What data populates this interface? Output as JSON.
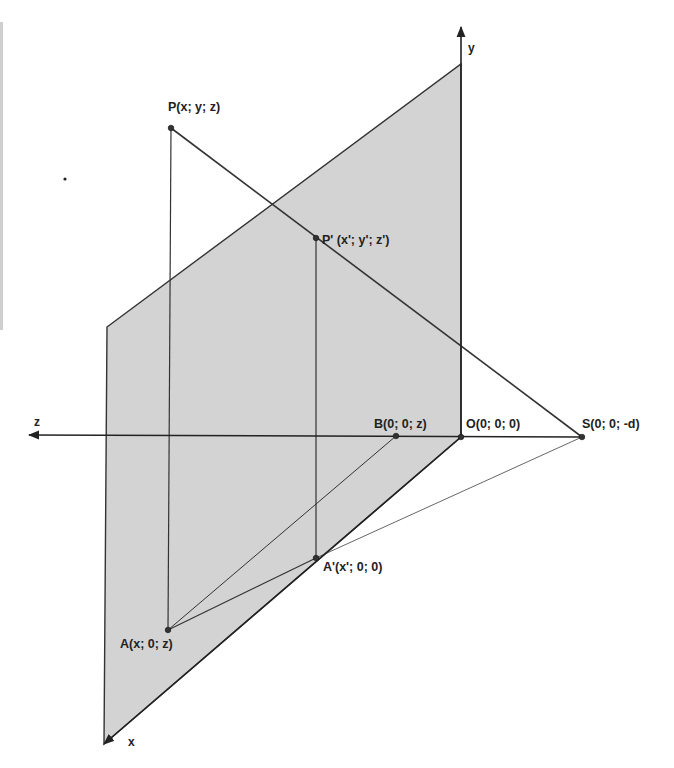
{
  "diagram": {
    "colors": {
      "plane_fill": "#d3d3d3",
      "line": "#333333",
      "thin_line": "#555555",
      "background": "#ffffff"
    },
    "axes": {
      "x": {
        "label": "x",
        "from": [
          461,
          437
        ],
        "to": [
          104,
          744
        ],
        "label_pos": [
          128,
          746
        ]
      },
      "y": {
        "label": "y",
        "from": [
          461,
          437
        ],
        "to": [
          461,
          27
        ],
        "label_pos": [
          468,
          52
        ]
      },
      "z": {
        "label": "z",
        "from": [
          582,
          437
        ],
        "to": [
          29,
          435
        ],
        "label_pos": [
          34,
          426
        ]
      }
    },
    "plane": {
      "name": "projection plane",
      "points": [
        [
          107,
          327
        ],
        [
          461,
          64
        ],
        [
          461,
          437
        ],
        [
          104,
          744
        ]
      ]
    },
    "points": [
      {
        "id": "P",
        "label": "P(x; y; z)",
        "pos": [
          171,
          128
        ],
        "label_pos": [
          168,
          111
        ]
      },
      {
        "id": "P_prime",
        "label": "P' (x'; y'; z')",
        "pos": [
          316,
          238
        ],
        "label_pos": [
          322,
          244
        ]
      },
      {
        "id": "B",
        "label": "B(0; 0; z)",
        "pos": [
          396,
          436
        ],
        "label_pos": [
          374,
          428
        ]
      },
      {
        "id": "O",
        "label": "O(0; 0; 0)",
        "pos": [
          461,
          437
        ],
        "label_pos": [
          466,
          428
        ]
      },
      {
        "id": "S",
        "label": "S(0; 0; -d)",
        "pos": [
          582,
          437
        ],
        "label_pos": [
          582,
          428
        ]
      },
      {
        "id": "A_prime",
        "label": "A'(x'; 0; 0)",
        "pos": [
          316,
          558
        ],
        "label_pos": [
          323,
          571
        ]
      },
      {
        "id": "A",
        "label": "A(x; 0; z)",
        "pos": [
          168,
          630
        ],
        "label_pos": [
          120,
          648
        ]
      }
    ],
    "segments": [
      {
        "name": "P-A",
        "from": [
          171,
          128
        ],
        "to": [
          168,
          630
        ],
        "width": 1.2
      },
      {
        "name": "P-S",
        "from": [
          171,
          128
        ],
        "to": [
          582,
          437
        ],
        "width": 1.6
      },
      {
        "name": "Pprime-Aprime",
        "from": [
          316,
          238
        ],
        "to": [
          316,
          558
        ],
        "width": 1.2
      },
      {
        "name": "A-Aprime",
        "from": [
          168,
          630
        ],
        "to": [
          316,
          558
        ],
        "width": 1.2
      },
      {
        "name": "A-B",
        "from": [
          168,
          630
        ],
        "to": [
          396,
          436
        ],
        "width": 1.0
      },
      {
        "name": "Aprime-S",
        "from": [
          316,
          558
        ],
        "to": [
          582,
          437
        ],
        "width": 0.9
      }
    ],
    "stray_mark": {
      "pos": [
        65,
        179
      ]
    }
  }
}
